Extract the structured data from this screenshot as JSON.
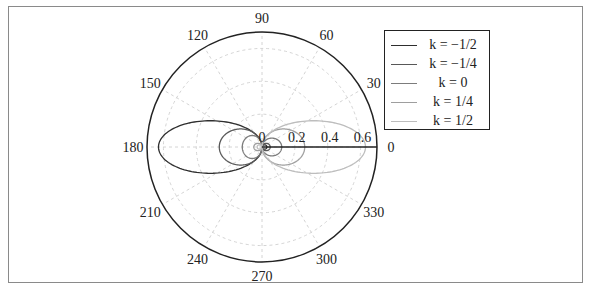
{
  "chart_data": {
    "type": "line",
    "subtype": "polar",
    "title": "",
    "angular_ticks": [
      0,
      30,
      60,
      90,
      120,
      150,
      180,
      210,
      240,
      270,
      300,
      330
    ],
    "radial_ticks": [
      0,
      0.2,
      0.4,
      0.6
    ],
    "radial_tick_labels": [
      "0",
      "0.2",
      "0.4",
      "0.6"
    ],
    "rlim": [
      0,
      0.7
    ],
    "grid": true,
    "legend_position": "upper right (outside plot)",
    "series": [
      {
        "name": "k = −1/2",
        "label_k": "−",
        "frac": "1/2",
        "color": "#2e2e2e",
        "lobe_angle_deg": 180,
        "extent": 0.63,
        "width": 0.16,
        "back_extent": 0.03
      },
      {
        "name": "k = −1/4",
        "label_k": "−",
        "frac": "1/4",
        "color": "#585858",
        "lobe_angle_deg": 180,
        "extent": 0.26,
        "width": 0.11,
        "back_extent": 0.05
      },
      {
        "name": "k = 0",
        "label_k": "",
        "frac": "0",
        "color": "#7c7c7c",
        "lobe_angle_deg": 180,
        "extent": 0.12,
        "width": 0.07,
        "back_extent": 0.12
      },
      {
        "name": "k = 1/4",
        "label_k": "",
        "frac": "1/4",
        "color": "#9e9e9e",
        "lobe_angle_deg": 0,
        "extent": 0.26,
        "width": 0.11,
        "back_extent": 0.05
      },
      {
        "name": "k = 1/2",
        "label_k": "",
        "frac": "1/2",
        "color": "#bdbdbd",
        "lobe_angle_deg": 0,
        "extent": 0.63,
        "width": 0.16,
        "back_extent": 0.03
      }
    ],
    "radial_axis_line": {
      "from": 0,
      "to": 0.7,
      "angle_deg": 0,
      "color": "#222222"
    }
  },
  "legend": {
    "entries": [
      {
        "text": "k = −1/2"
      },
      {
        "text": "k = −1/4"
      },
      {
        "text": "k = 0"
      },
      {
        "text": "k = 1/4"
      },
      {
        "text": "k = 1/2"
      }
    ]
  },
  "layout": {
    "cx": 262,
    "cy": 147,
    "outer_radius_px": 115,
    "grid_color": "#cfcfcf",
    "outer_circle_color": "#222222"
  }
}
